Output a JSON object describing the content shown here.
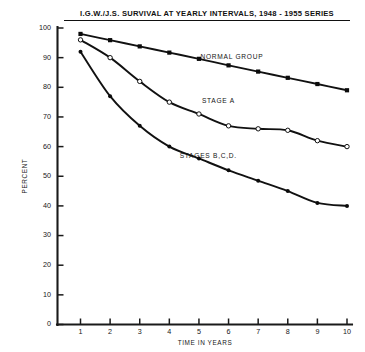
{
  "chart_data": {
    "type": "line",
    "title": "I.G.W./J.S. SURVIVAL AT YEARLY INTERVALS,  1948 - 1955 SERIES",
    "xlabel": "TIME IN YEARS",
    "ylabel": "PERCENT",
    "xlim": [
      0,
      10
    ],
    "ylim": [
      0,
      100
    ],
    "grid": false,
    "legend_position": "inline-annotation",
    "x": [
      1,
      2,
      3,
      4,
      5,
      6,
      7,
      8,
      9,
      10
    ],
    "xticks": [
      "1",
      "2",
      "3",
      "4",
      "5",
      "6",
      "7",
      "8",
      "9",
      "10"
    ],
    "yticks": [
      "0",
      "10",
      "20",
      "30",
      "40",
      "50",
      "60",
      "70",
      "80",
      "90",
      "100"
    ],
    "series": [
      {
        "name": "NORMAL GROUP",
        "marker": "filled-square",
        "values": [
          98,
          95.9,
          93.8,
          91.7,
          89.6,
          87.4,
          85.3,
          83.2,
          81.1,
          79
        ]
      },
      {
        "name": "STAGE A",
        "marker": "open-circle",
        "values": [
          96,
          90,
          82,
          75,
          71,
          67,
          66,
          65.5,
          62,
          60
        ]
      },
      {
        "name": "STAGES B,C,D.",
        "marker": "filled-circle",
        "values": [
          92,
          77,
          67,
          60,
          56,
          52,
          48.5,
          45,
          41,
          40
        ]
      }
    ],
    "annotations": [
      {
        "text": "NORMAL GROUP",
        "x": 5.05,
        "y": 89.6
      },
      {
        "text": "STAGE A",
        "x": 5.1,
        "y": 74.7
      },
      {
        "text": "STAGES B,C,D.",
        "x": 4.35,
        "y": 56.2
      }
    ]
  }
}
